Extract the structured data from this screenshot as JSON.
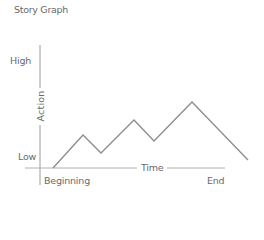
{
  "title": "Story Graph",
  "y_axis": {
    "label": "Action",
    "high_label": "High",
    "low_label": "Low"
  },
  "x_axis": {
    "label": "Time",
    "start_label": "Beginning",
    "end_label": "End"
  },
  "colors": {
    "axis": "#9a9a9a",
    "line": "#8c8c8c",
    "text": "#6a6a6a"
  },
  "chart_data": {
    "type": "line",
    "title": "Story Graph",
    "xlabel": "Time",
    "ylabel": "Action",
    "x_tick_labels": [
      "Beginning",
      "End"
    ],
    "y_tick_labels": [
      "Low",
      "High"
    ],
    "grid": false,
    "legend": null,
    "series": [
      {
        "name": "story-arc",
        "points_px": [
          [
            53,
            168
          ],
          [
            83,
            135
          ],
          [
            101,
            153
          ],
          [
            134,
            120
          ],
          [
            154,
            141
          ],
          [
            192,
            102
          ],
          [
            248,
            160
          ]
        ],
        "x": [
          0,
          0.15,
          0.25,
          0.41,
          0.51,
          0.71,
          1.0
        ],
        "y": [
          0,
          0.33,
          0.15,
          0.48,
          0.27,
          0.66,
          0.08
        ]
      }
    ]
  }
}
